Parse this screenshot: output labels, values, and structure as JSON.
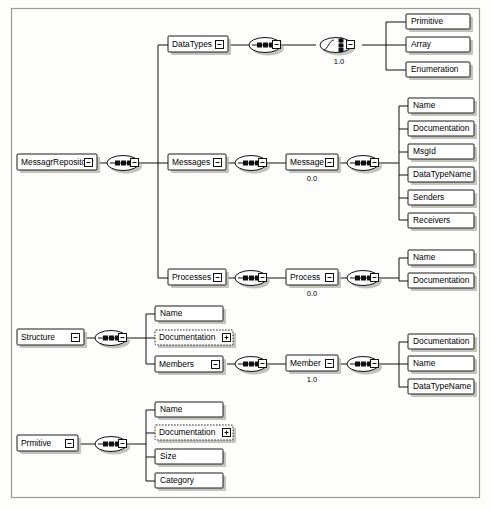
{
  "diagram": {
    "type": "xml-schema-tree",
    "frame_color": "#9a9a96",
    "background": "#fdfdfc",
    "icons": {
      "sequence": "sequence-compositor-icon",
      "choice": "choice-compositor-icon",
      "collapse": "collapse-minus-box-icon",
      "expand": "expand-plus-box-icon"
    },
    "roots": [
      {
        "id": "messagr-repository",
        "label": "MessagrRepository",
        "control": "minus",
        "children": [
          {
            "id": "datatypes",
            "label": "DataTypes",
            "control": "minus",
            "compositor": "sequence",
            "children": [
              {
                "id": "datatypes-choice",
                "label": "",
                "compositor": "choice",
                "cardinality": "1.0",
                "children": [
                  {
                    "id": "primitive-leaf",
                    "label": "Primitive",
                    "style": "solid"
                  },
                  {
                    "id": "array-leaf",
                    "label": "Array",
                    "style": "solid"
                  },
                  {
                    "id": "enumeration-leaf",
                    "label": "Enumeration",
                    "style": "solid"
                  }
                ]
              }
            ]
          },
          {
            "id": "messages",
            "label": "Messages",
            "control": "minus",
            "compositor": "sequence",
            "children": [
              {
                "id": "message",
                "label": "Message",
                "control": "minus",
                "cardinality": "0.0",
                "compositor": "sequence",
                "children": [
                  {
                    "id": "message-name",
                    "label": "Name",
                    "style": "solid"
                  },
                  {
                    "id": "message-documentation",
                    "label": "Documentation",
                    "style": "solid"
                  },
                  {
                    "id": "message-msgid",
                    "label": "MsgId",
                    "style": "solid"
                  },
                  {
                    "id": "message-datatypename",
                    "label": "DataTypeName",
                    "style": "solid"
                  },
                  {
                    "id": "message-senders",
                    "label": "Senders",
                    "style": "solid"
                  },
                  {
                    "id": "message-receivers",
                    "label": "Receivers",
                    "style": "solid"
                  }
                ]
              }
            ]
          },
          {
            "id": "processes",
            "label": "Processes",
            "control": "minus",
            "compositor": "sequence",
            "children": [
              {
                "id": "process",
                "label": "Process",
                "control": "minus",
                "cardinality": "0.0",
                "compositor": "sequence",
                "children": [
                  {
                    "id": "process-name",
                    "label": "Name",
                    "style": "solid"
                  },
                  {
                    "id": "process-documentation",
                    "label": "Documentation",
                    "style": "solid"
                  }
                ]
              }
            ]
          }
        ]
      },
      {
        "id": "structure",
        "label": "Structure",
        "control": "minus",
        "compositor": "sequence",
        "children": [
          {
            "id": "structure-name",
            "label": "Name",
            "style": "solid"
          },
          {
            "id": "structure-documentation",
            "label": "Documentation",
            "style": "dashed",
            "control": "plus"
          },
          {
            "id": "members",
            "label": "Members",
            "control": "minus",
            "compositor": "sequence",
            "children": [
              {
                "id": "member",
                "label": "Member",
                "control": "minus",
                "cardinality": "1.0",
                "compositor": "sequence",
                "children": [
                  {
                    "id": "member-documentation",
                    "label": "Documentation",
                    "style": "solid"
                  },
                  {
                    "id": "member-name",
                    "label": "Name",
                    "style": "solid"
                  },
                  {
                    "id": "member-datatypename",
                    "label": "DataTypeName",
                    "style": "solid"
                  }
                ]
              }
            ]
          }
        ]
      },
      {
        "id": "prmitive",
        "label": "Prmitive",
        "control": "minus",
        "compositor": "sequence",
        "children": [
          {
            "id": "prmitive-name",
            "label": "Name",
            "style": "solid"
          },
          {
            "id": "prmitive-documentation",
            "label": "Documentation",
            "style": "dashed",
            "control": "plus"
          },
          {
            "id": "prmitive-size",
            "label": "Size",
            "style": "solid"
          },
          {
            "id": "prmitive-category",
            "label": "Category",
            "style": "solid"
          }
        ]
      }
    ],
    "labels": {
      "root_repository": "MessagrRepository",
      "datatypes": "DataTypes",
      "messages": "Messages",
      "processes": "Processes",
      "message": "Message",
      "process": "Process",
      "structure": "Structure",
      "members": "Members",
      "member": "Member",
      "prmitive": "Prmitive",
      "primitive_leaf": "Primitive",
      "array_leaf": "Array",
      "enumeration_leaf": "Enumeration",
      "name": "Name",
      "documentation": "Documentation",
      "msgid": "MsgId",
      "datatypename": "DataTypeName",
      "senders": "Senders",
      "receivers": "Receivers",
      "size": "Size",
      "category": "Category"
    },
    "cardinalities": {
      "datatypes_choice": "1.0",
      "message": "0.0",
      "process": "0.0",
      "member": "1.0"
    }
  }
}
